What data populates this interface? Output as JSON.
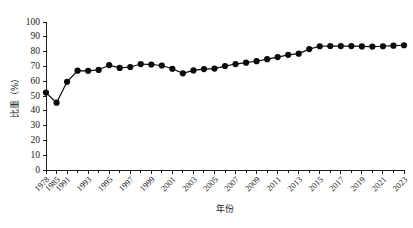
{
  "chart_data": {
    "type": "line",
    "title": "",
    "xlabel": "年份",
    "ylabel": "比重（%）",
    "ylim": [
      0,
      100
    ],
    "ytick_step": 10,
    "grid": false,
    "legend": "none",
    "marker": "filled-circle",
    "line_color": "#0a0a0a",
    "marker_color": "#0a0a0a",
    "yticks": [
      "0",
      "10",
      "20",
      "30",
      "40",
      "50",
      "60",
      "70",
      "80",
      "90",
      "100"
    ],
    "x": [
      1978,
      1985,
      1991,
      1992,
      1993,
      1994,
      1995,
      1996,
      1997,
      1998,
      1999,
      2000,
      2001,
      2002,
      2003,
      2004,
      2005,
      2006,
      2007,
      2008,
      2009,
      2010,
      2011,
      2012,
      2013,
      2014,
      2015,
      2016,
      2017,
      2018,
      2019,
      2020,
      2021,
      2022,
      2023
    ],
    "xtick_labels": [
      "1978",
      "1985",
      "1991",
      "1993",
      "1995",
      "1997",
      "1999",
      "2001",
      "2003",
      "2005",
      "2007",
      "2009",
      "2011",
      "2013",
      "2015",
      "2017",
      "2019",
      "2021",
      "2023"
    ],
    "values": [
      52.3,
      45.5,
      59.6,
      67.1,
      67.0,
      67.6,
      70.9,
      69.0,
      69.6,
      71.6,
      71.3,
      70.6,
      68.4,
      65.3,
      67.3,
      68.2,
      68.5,
      70.2,
      71.6,
      72.5,
      73.5,
      74.9,
      76.3,
      77.8,
      78.6,
      81.7,
      83.6,
      83.8,
      83.7,
      83.7,
      83.5,
      83.4,
      83.6,
      84.0,
      84.3
    ]
  }
}
